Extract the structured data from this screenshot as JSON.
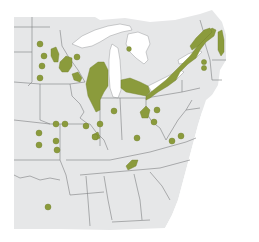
{
  "map": {
    "type": "range-map",
    "region": "Eastern United States (Midwest, Great Lakes, Northeast, Southeast)",
    "colors": {
      "page_background": "#ffffff",
      "land": "#e6e7e8",
      "water": "#ffffff",
      "borders": "#7d7f82",
      "range": "#8b9b3c",
      "range_edge": "#6f7f2a"
    },
    "legend": null,
    "labels": []
  }
}
